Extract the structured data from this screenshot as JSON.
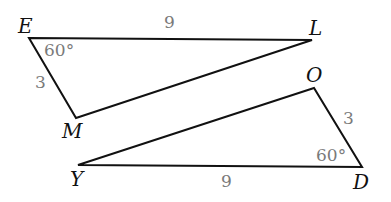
{
  "figure": {
    "colors": {
      "line": "#111111",
      "vertex_label": "#111111",
      "measure_label": "#7a7a7a"
    },
    "triangles": [
      {
        "name": "ELM",
        "vertices": {
          "E": {
            "label": "E",
            "x": 29,
            "y": 38
          },
          "L": {
            "label": "L",
            "x": 312,
            "y": 40
          },
          "M": {
            "label": "M",
            "x": 76,
            "y": 118
          }
        },
        "measures": {
          "side_EL": "9",
          "side_EM": "3",
          "angle_E": "60°"
        }
      },
      {
        "name": "DYO",
        "vertices": {
          "O": {
            "label": "O",
            "x": 314,
            "y": 88
          },
          "Y": {
            "label": "Y",
            "x": 78,
            "y": 165
          },
          "D": {
            "label": "D",
            "x": 362,
            "y": 167
          }
        },
        "measures": {
          "side_YD": "9",
          "side_OD": "3",
          "angle_D": "60°"
        }
      }
    ]
  }
}
